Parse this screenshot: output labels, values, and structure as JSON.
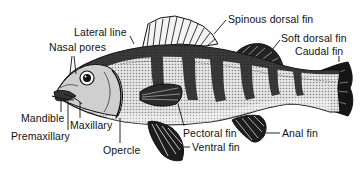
{
  "diagram": {
    "colors": {
      "ink": "#111111",
      "background": "#ffffff",
      "body_fill": "#d9d9d9",
      "band": "#2a2a2a"
    },
    "labels": [
      {
        "id": "lateral_line",
        "text": "Lateral line",
        "x": 74,
        "y": 27
      },
      {
        "id": "nasal_pores",
        "text": "Nasal pores",
        "x": 49,
        "y": 42
      },
      {
        "id": "spinous_dorsal_fin",
        "text": "Spinous dorsal fin",
        "x": 228,
        "y": 14
      },
      {
        "id": "soft_dorsal_fin",
        "text": "Soft dorsal fin",
        "x": 281,
        "y": 33
      },
      {
        "id": "caudal_fin",
        "text": "Caudal fin",
        "x": 295,
        "y": 46
      },
      {
        "id": "mandible",
        "text": "Mandible",
        "x": 21,
        "y": 113
      },
      {
        "id": "maxillary",
        "text": "Maxillary",
        "x": 70,
        "y": 120
      },
      {
        "id": "premaxillary",
        "text": "Premaxillary",
        "x": 11,
        "y": 131
      },
      {
        "id": "opercle",
        "text": "Opercle",
        "x": 103,
        "y": 145
      },
      {
        "id": "pectoral_fin",
        "text": "Pectoral fin",
        "x": 183,
        "y": 128
      },
      {
        "id": "ventral_fin",
        "text": "Ventral fin",
        "x": 192,
        "y": 142
      },
      {
        "id": "anal_fin",
        "text": "Anal fin",
        "x": 282,
        "y": 128
      }
    ]
  }
}
